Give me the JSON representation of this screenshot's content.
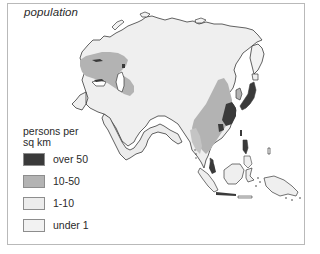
{
  "figure": {
    "title": "population",
    "colors": {
      "frame": "#b9b9b9",
      "coast": "#3a3a3a",
      "over_50": "#3a3a3a",
      "10_50": "#b3b3b3",
      "1_10": "#ececec",
      "under_1": "#f2f2f2"
    }
  },
  "legend": {
    "title_line1": "persons per",
    "title_line2": "sq km",
    "items": [
      {
        "label": "over 50",
        "color": "#3a3a3a"
      },
      {
        "label": "10-50",
        "color": "#b3b3b3"
      },
      {
        "label": "1-10",
        "color": "#ececec"
      },
      {
        "label": "under 1",
        "color": "#f2f2f2"
      }
    ]
  },
  "map": {
    "region": "Asia",
    "theme": "population density",
    "unit": "persons per sq km"
  }
}
